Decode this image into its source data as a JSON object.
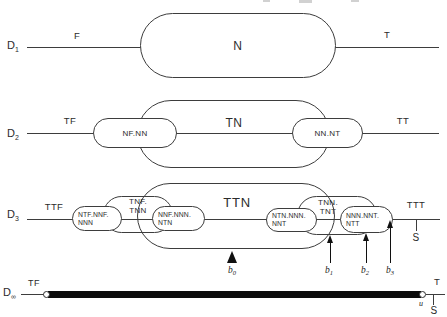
{
  "row1": {
    "level": "D",
    "sub": "1",
    "left": "F",
    "capsule": "N",
    "right": "T"
  },
  "row2": {
    "level": "D",
    "sub": "2",
    "left": "TF",
    "outer": "TN",
    "cap_left": "NF.NN",
    "cap_right": "NN.NT",
    "right": "TT"
  },
  "row3": {
    "level": "D",
    "sub": "3",
    "left": "TTF",
    "outer": "TTN",
    "right": "TTT",
    "s": "S",
    "med_left": {
      "l1": "TNF.",
      "l2": "TNN"
    },
    "med_right": {
      "l1": "TNN.",
      "l2": "TNT"
    },
    "small1": {
      "l1": "NTF.NNF.",
      "l2": "NNN"
    },
    "small2": {
      "l1": "NNF.NNN.",
      "l2": "NTN"
    },
    "small3": {
      "l1": "NTN.NNN.",
      "l2": "NNT"
    },
    "small4": {
      "l1": "NNN.NNT.",
      "l2": "NTT"
    },
    "b0": {
      "b": "b",
      "s": "0"
    },
    "b1": {
      "b": "b",
      "s": "1"
    },
    "b2": {
      "b": "b",
      "s": "2"
    },
    "b3": {
      "b": "b",
      "s": "3"
    }
  },
  "row4": {
    "level": "D",
    "sub": "∞",
    "left": "TF",
    "right": "T",
    "u": "u",
    "s": "S"
  },
  "colors": {
    "ink": "#3d3d3d",
    "bar": "#0b0b0b",
    "background": "#ffffff"
  }
}
